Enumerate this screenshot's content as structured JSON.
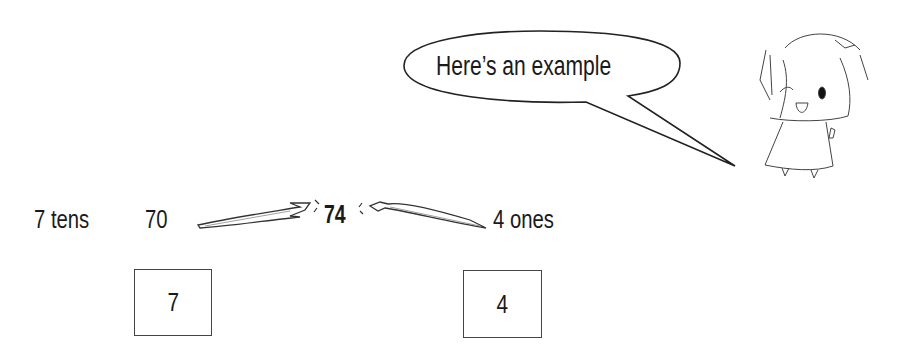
{
  "speech_bubble": {
    "text": "Here’s an example"
  },
  "decomposition": {
    "tens_label": "7 tens",
    "tens_value": "70",
    "number": "74",
    "ones_label": "4 ones"
  },
  "answer_boxes": [
    {
      "value": "7"
    },
    {
      "value": "4"
    }
  ],
  "character": {
    "icon": "cartoon-girl-winking-thumbs-up-icon"
  },
  "colors": {
    "ink": "#1a1a1a",
    "background": "#ffffff"
  }
}
